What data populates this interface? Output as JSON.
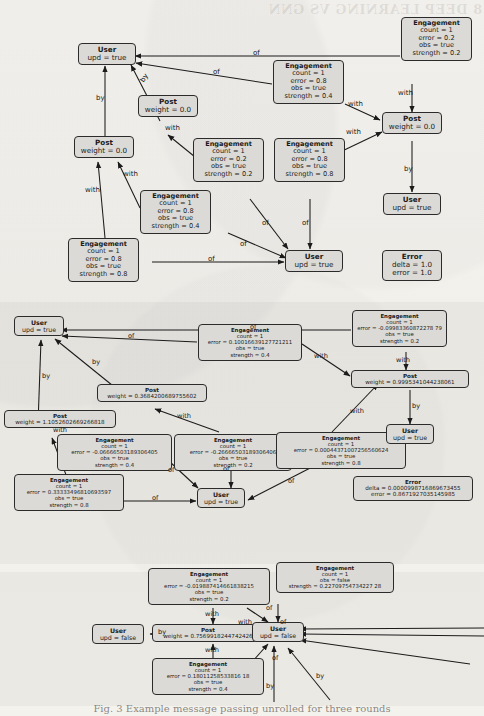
{
  "page": {
    "width": 484,
    "height": 716,
    "bleed_header": "8  DEEP LEARNING VS GNN",
    "caption": "Fig. 3  Example message passing unrolled for three rounds",
    "colors": {
      "paper": "#f4f2ee",
      "node_fill": "#dcdad6",
      "node_stroke": "#2b2b2b",
      "panel_shade": "rgba(0,0,0,.035)",
      "text": "#1b1b1b"
    },
    "edge_labels": [
      "of",
      "by",
      "with"
    ]
  },
  "panel1": {
    "name": "round-1-graph",
    "nodes": [
      {
        "id": "p1_user_top",
        "type": "User",
        "title": "User",
        "rows": [
          "upd = true"
        ]
      },
      {
        "id": "p1_eng_tr",
        "type": "Engagement",
        "title": "Engagement",
        "rows": [
          "count = 1",
          "error = 0.2",
          "obs = true",
          "strength = 0.2"
        ]
      },
      {
        "id": "p1_eng_mr",
        "type": "Engagement",
        "title": "Engagement",
        "rows": [
          "count = 1",
          "error = 0.8",
          "obs = true",
          "strength = 0.4"
        ]
      },
      {
        "id": "p1_post_r",
        "type": "Post",
        "title": "Post",
        "rows": [
          "weight = 0.0"
        ]
      },
      {
        "id": "p1_post_mid",
        "type": "Post",
        "title": "Post",
        "rows": [
          "weight = 0.0"
        ]
      },
      {
        "id": "p1_post_l",
        "type": "Post",
        "title": "Post",
        "rows": [
          "weight = 0.0"
        ]
      },
      {
        "id": "p1_eng_c1",
        "type": "Engagement",
        "title": "Engagement",
        "rows": [
          "count = 1",
          "error = 0.2",
          "obs = true",
          "strength = 0.2"
        ]
      },
      {
        "id": "p1_eng_c2",
        "type": "Engagement",
        "title": "Engagement",
        "rows": [
          "count = 1",
          "error = 0.8",
          "obs = true",
          "strength = 0.8"
        ]
      },
      {
        "id": "p1_eng_c3",
        "type": "Engagement",
        "title": "Engagement",
        "rows": [
          "count = 1",
          "error = 0.8",
          "obs = true",
          "strength = 0.4"
        ]
      },
      {
        "id": "p1_eng_bl",
        "type": "Engagement",
        "title": "Engagement",
        "rows": [
          "count = 1",
          "error = 0.8",
          "obs = true",
          "strength = 0.8"
        ]
      },
      {
        "id": "p1_user_rb",
        "type": "User",
        "title": "User",
        "rows": [
          "upd = true"
        ]
      },
      {
        "id": "p1_user_c",
        "type": "User",
        "title": "User",
        "rows": [
          "upd = true"
        ]
      },
      {
        "id": "p1_error",
        "type": "Error",
        "title": "Error",
        "rows": [
          "delta = 1.0",
          "error = 1.0"
        ]
      }
    ],
    "labels": [
      {
        "text": "of",
        "x": 253,
        "y": 47
      },
      {
        "text": "of",
        "x": 213,
        "y": 73
      },
      {
        "text": "by",
        "x": 102,
        "y": 72
      },
      {
        "text": "by",
        "x": 79,
        "y": 93
      },
      {
        "text": "with",
        "x": 131,
        "y": 123
      },
      {
        "text": "with",
        "x": 358,
        "y": 103
      },
      {
        "text": "with",
        "x": 393,
        "y": 90
      },
      {
        "text": "with",
        "x": 374,
        "y": 137
      },
      {
        "text": "with",
        "x": 69,
        "y": 182
      },
      {
        "text": "with",
        "x": 105,
        "y": 175
      },
      {
        "text": "by",
        "x": 414,
        "y": 207
      },
      {
        "text": "of",
        "x": 270,
        "y": 225
      },
      {
        "text": "of",
        "x": 305,
        "y": 225
      },
      {
        "text": "of",
        "x": 247,
        "y": 249
      },
      {
        "text": "of",
        "x": 206,
        "y": 272
      }
    ]
  },
  "panel2": {
    "name": "round-2-graph",
    "nodes": [
      {
        "id": "p2_user_top",
        "type": "User",
        "title": "User",
        "rows": [
          "upd = true"
        ]
      },
      {
        "id": "p2_eng_tr",
        "type": "Engagement",
        "title": "Engagement",
        "rows": [
          "count = 1",
          "error = -0.09983360872278 79",
          "obs = true",
          "strength = 0.2"
        ]
      },
      {
        "id": "p2_eng_tm",
        "type": "Engagement",
        "title": "Engagement",
        "rows": [
          "count = 1",
          "error = 0.10016639127721211",
          "obs = true",
          "strength = 0.4"
        ]
      },
      {
        "id": "p2_post_r",
        "type": "Post",
        "title": "Post",
        "rows": [
          "weight = 0.9995341044238061"
        ]
      },
      {
        "id": "p2_post_m",
        "type": "Post",
        "title": "Post",
        "rows": [
          "weight = 0.3684200689755602"
        ]
      },
      {
        "id": "p2_post_l",
        "type": "Post",
        "title": "Post",
        "rows": [
          "weight = 1.1052602669266818"
        ]
      },
      {
        "id": "p2_eng_c1",
        "type": "Engagement",
        "title": "Engagement",
        "rows": [
          "count = 1",
          "error = -0.06666503189306405",
          "obs = true",
          "strength = 0.4"
        ]
      },
      {
        "id": "p2_eng_c2",
        "type": "Engagement",
        "title": "Engagement",
        "rows": [
          "count = 1",
          "error = -0.26666503189306406",
          "obs = true",
          "strength = 0.2"
        ]
      },
      {
        "id": "p2_eng_c3",
        "type": "Engagement",
        "title": "Engagement",
        "rows": [
          "count = 1",
          "error = 0.00044371007256560624",
          "obs = true",
          "strength = 0.8"
        ]
      },
      {
        "id": "p2_eng_bl",
        "type": "Engagement",
        "title": "Engagement",
        "rows": [
          "count = 1",
          "error = 0.33333496810693597",
          "obs = true",
          "strength = 0.8"
        ]
      },
      {
        "id": "p2_user_r",
        "type": "User",
        "title": "User",
        "rows": [
          "upd = true"
        ]
      },
      {
        "id": "p2_user_c",
        "type": "User",
        "title": "User",
        "rows": [
          "upd = true"
        ]
      },
      {
        "id": "p2_error",
        "type": "Error",
        "title": "Error",
        "rows": [
          "delta = 0.0000998716869673455",
          "error = 0.8671927035145985"
        ]
      }
    ],
    "labels": [
      {
        "text": "of",
        "x": 252,
        "y": 19
      },
      {
        "text": "of",
        "x": 135,
        "y": 34
      },
      {
        "text": "by",
        "x": 104,
        "y": 60
      },
      {
        "text": "by",
        "x": 52,
        "y": 77
      },
      {
        "text": "with",
        "x": 265,
        "y": 80
      },
      {
        "text": "with",
        "x": 337,
        "y": 60
      },
      {
        "text": "with",
        "x": 167,
        "y": 113
      },
      {
        "text": "with",
        "x": 378,
        "y": 112
      },
      {
        "text": "with",
        "x": 73,
        "y": 125
      },
      {
        "text": "by",
        "x": 419,
        "y": 140
      },
      {
        "text": "of",
        "x": 176,
        "y": 188
      },
      {
        "text": "of",
        "x": 225,
        "y": 184
      },
      {
        "text": "of",
        "x": 160,
        "y": 207
      },
      {
        "text": "of",
        "x": 292,
        "y": 202
      }
    ]
  },
  "panel3": {
    "name": "round-3-graph",
    "nodes": [
      {
        "id": "p3_eng_t1",
        "type": "Engagement",
        "title": "Engagement",
        "rows": [
          "count = 1",
          "error = -0.019887414661838215",
          "obs = true",
          "strength = 0.2"
        ]
      },
      {
        "id": "p3_eng_t2",
        "type": "Engagement",
        "title": "Engagement",
        "rows": [
          "count = 1",
          "obs = false",
          "strength = 0.22709754734227 28"
        ]
      },
      {
        "id": "p3_user_l",
        "type": "User",
        "title": "User",
        "rows": [
          "upd = false"
        ]
      },
      {
        "id": "p3_post",
        "type": "Post",
        "title": "Post",
        "rows": [
          "weight = 0.7569918244742426"
        ]
      },
      {
        "id": "p3_user_c",
        "type": "User",
        "title": "User",
        "rows": [
          "upd = false"
        ]
      },
      {
        "id": "p3_eng_b",
        "type": "Engagement",
        "title": "Engagement",
        "rows": [
          "count = 1",
          "error = 0.18011258533816 18",
          "obs = true",
          "strength = 0.4"
        ]
      }
    ],
    "labels": [
      {
        "text": "with",
        "x": 212,
        "y": 37
      },
      {
        "text": "of",
        "x": 268,
        "y": 33
      },
      {
        "text": "with",
        "x": 251,
        "y": 52
      },
      {
        "text": "of",
        "x": 281,
        "y": 52
      },
      {
        "text": "by",
        "x": 128,
        "y": 56
      },
      {
        "text": "with",
        "x": 212,
        "y": 74
      },
      {
        "text": "of",
        "x": 278,
        "y": 78
      },
      {
        "text": "by",
        "x": 265,
        "y": 125
      },
      {
        "text": "by",
        "x": 316,
        "y": 110
      }
    ]
  }
}
